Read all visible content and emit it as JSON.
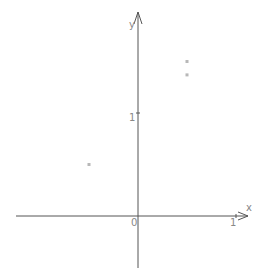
{
  "chart_data": {
    "type": "scatter",
    "title": "",
    "xlabel": "x",
    "ylabel": "y",
    "origin_label": "0",
    "xlim": [
      -1.3,
      1.15
    ],
    "ylim": [
      -0.5,
      2.0
    ],
    "x_ticks": [
      {
        "value": 1,
        "label": "1"
      }
    ],
    "y_ticks": [
      {
        "value": 1,
        "label": "1"
      }
    ],
    "grid": false,
    "legend": "none",
    "series": [
      {
        "name": "points",
        "color": "#b8b8b8",
        "points": [
          {
            "x": 0.5,
            "y": 1.5
          },
          {
            "x": 0.5,
            "y": 1.37
          },
          {
            "x": -0.5,
            "y": 0.5
          }
        ]
      }
    ]
  }
}
